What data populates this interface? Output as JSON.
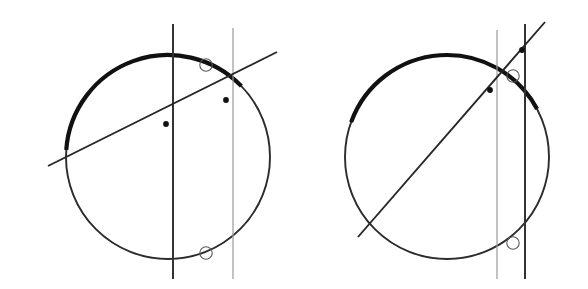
{
  "figure": {
    "width": 588,
    "height": 289,
    "background": "#ffffff",
    "colors": {
      "circle_thin": "#2b2b2b",
      "circle_thick": "#111111",
      "vertical_dark": "#333333",
      "vertical_light": "#9a9a9a",
      "oblique": "#262626",
      "marker_filled": "#111111",
      "marker_hollow_stroke": "#5a5a5a"
    },
    "strokes": {
      "circle_thin_width": 1.9,
      "circle_thick_width": 4.2,
      "vertical_dark_width": 2.0,
      "vertical_light_width": 1.2,
      "oblique_width": 1.9,
      "marker_hollow_width": 1.1
    },
    "markers": {
      "filled_radius": 2.9,
      "hollow_radius": 6.2
    }
  },
  "panels": [
    {
      "id": "left-panel",
      "label": "left construction",
      "circle": {
        "cx": 168,
        "cy": 157,
        "r": 102
      },
      "thick_arc": {
        "start_angle_deg": 184,
        "end_angle_deg": 316,
        "note": "thick arc sweeps clockwise from the left oblique intersection down around the bottom and up to the top of the circle, continuing to the right oblique intersection"
      },
      "vertical_lines": [
        {
          "id": "vertical-dark-left",
          "x": 173,
          "y1": 24,
          "y2": 279,
          "weight": "dark"
        },
        {
          "id": "vertical-light-left",
          "x": 233,
          "y1": 28,
          "y2": 279,
          "weight": "light"
        }
      ],
      "oblique_line": {
        "x1": 48,
        "y1": 166,
        "x2": 277,
        "y2": 52
      },
      "filled_points": [
        {
          "id": "point-a",
          "cx": 166,
          "cy": 124
        },
        {
          "id": "point-b",
          "cx": 226,
          "cy": 100
        }
      ],
      "hollow_points": [
        {
          "id": "hollow-top",
          "cx": 206,
          "cy": 65
        },
        {
          "id": "hollow-bottom",
          "cx": 206,
          "cy": 253
        }
      ]
    },
    {
      "id": "right-panel",
      "label": "right construction",
      "circle": {
        "cx": 447,
        "cy": 157,
        "r": 102
      },
      "thick_arc": {
        "start_angle_deg": 200,
        "end_angle_deg": 332,
        "note": "thick arc sweeps clockwise from the lower-left oblique intersection around the bottom and up the right side to the upper oblique intersection"
      },
      "vertical_lines": [
        {
          "id": "vertical-light-right",
          "x": 497,
          "y1": 30,
          "y2": 279,
          "weight": "light"
        },
        {
          "id": "vertical-dark-right",
          "x": 525,
          "y1": 24,
          "y2": 279,
          "weight": "dark"
        }
      ],
      "oblique_line": {
        "x1": 358,
        "y1": 237,
        "x2": 545,
        "y2": 22
      },
      "filled_points": [
        {
          "id": "point-a",
          "cx": 490,
          "cy": 90
        },
        {
          "id": "point-b",
          "cx": 522,
          "cy": 50
        }
      ],
      "hollow_points": [
        {
          "id": "hollow-top",
          "cx": 513,
          "cy": 76
        },
        {
          "id": "hollow-bottom",
          "cx": 513,
          "cy": 243
        }
      ]
    }
  ]
}
